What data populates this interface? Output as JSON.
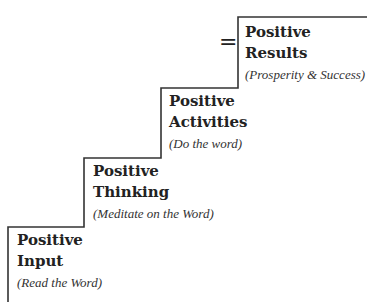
{
  "diagram": {
    "type": "staircase",
    "line_color": "#333333",
    "text_color": "#222222",
    "equals_symbol": "=",
    "steps": [
      {
        "title_line1": "Positive",
        "title_line2": "Input",
        "subtitle": "(Read the Word)"
      },
      {
        "title_line1": "Positive",
        "title_line2": "Thinking",
        "subtitle": "(Meditate on the Word)"
      },
      {
        "title_line1": "Positive",
        "title_line2": "Activities",
        "subtitle": "(Do the word)"
      },
      {
        "title_line1": "Positive",
        "title_line2": "Results",
        "subtitle": "(Prosperity & Success)"
      }
    ]
  }
}
